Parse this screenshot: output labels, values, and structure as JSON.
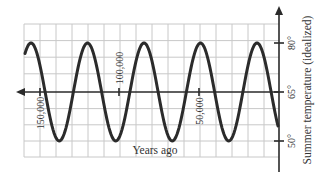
{
  "chart_data": {
    "type": "line",
    "title": "",
    "xlabel": "Years ago",
    "ylabel": "Summer temperature (idealized)",
    "x_direction": "decreasing to the right (past on the left, present at the y-axis)",
    "xlim": [
      165000,
      0
    ],
    "ylim": [
      45,
      86
    ],
    "grid": true,
    "legend": null,
    "x_ticks": [
      {
        "value": 150000,
        "label": "150,000"
      },
      {
        "value": 100000,
        "label": "100,000"
      },
      {
        "value": 50000,
        "label": "50,000"
      }
    ],
    "y_ticks": [
      {
        "value": 80,
        "label": "80°"
      },
      {
        "value": 65,
        "label": "65°"
      },
      {
        "value": 50,
        "label": "50°"
      }
    ],
    "series": [
      {
        "name": "Summer temperature (idealized)",
        "model": "sinusoid",
        "midline": 65,
        "amplitude": 15,
        "period_years": 35600,
        "max": 80,
        "min": 50,
        "peaks_years_ago": [
          160000,
          123000,
          90000,
          54000,
          13000
        ],
        "troughs_years_ago": [
          142000,
          107000,
          72000,
          37000
        ],
        "x": [
          160000,
          151000,
          142000,
          133000,
          124000,
          116000,
          107000,
          98000,
          89000,
          80000,
          72000,
          63000,
          54000,
          45000,
          37000,
          28000,
          19000,
          10000,
          1000,
          0
        ],
        "values": [
          80,
          65,
          50,
          65,
          80,
          65,
          50,
          65,
          80,
          65,
          50,
          65,
          80,
          65,
          50,
          65,
          78,
          79,
          55,
          54
        ]
      }
    ]
  },
  "labels": {
    "x_axis_title": "Years ago",
    "y_axis_title": "Summer temperature (idealized)",
    "x_tick_150000": "150,000",
    "x_tick_100000": "100,000",
    "x_tick_50000": "50,000",
    "y_tick_80": "80°",
    "y_tick_65": "65°",
    "y_tick_50": "50°"
  },
  "colors": {
    "curve": "#2b2b2b",
    "axis": "#2a2a2a",
    "grid": "#c8c8c8",
    "background": "#ffffff"
  }
}
